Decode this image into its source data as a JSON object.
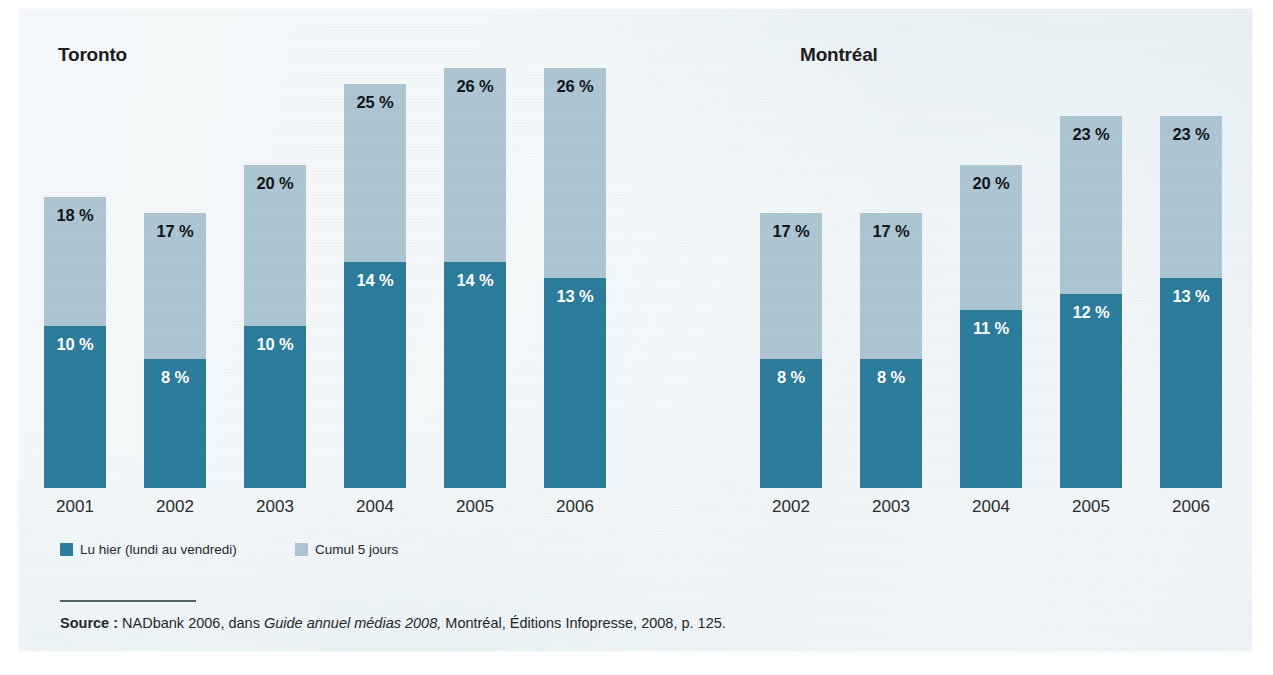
{
  "figure": {
    "background_color": "#e6eff4",
    "page_color": "#ffffff"
  },
  "colors": {
    "series_dark": "#2c7c9c",
    "series_light": "#aec6d3",
    "label_dark": "#111418",
    "label_light": "#ffffff",
    "text": "#23282c",
    "panel_bg": "#e6eff4"
  },
  "panels": [
    {
      "title": "Toronto",
      "categories": [
        "2001",
        "2002",
        "2003",
        "2004",
        "2005",
        "2006"
      ],
      "bottom_values": [
        10,
        8,
        10,
        14,
        14,
        13
      ],
      "top_values": [
        18,
        17,
        20,
        25,
        26,
        26
      ],
      "bottom_labels": [
        "10 %",
        "8 %",
        "10 %",
        "14 %",
        "14 %",
        "13 %"
      ],
      "top_labels": [
        "18 %",
        "17 %",
        "20 %",
        "25 %",
        "26 %",
        "26 %"
      ]
    },
    {
      "title": "Montréal",
      "categories": [
        "2002",
        "2003",
        "2004",
        "2005",
        "2006"
      ],
      "bottom_values": [
        8,
        8,
        11,
        12,
        13
      ],
      "top_values": [
        17,
        17,
        20,
        23,
        23
      ],
      "bottom_labels": [
        "8 %",
        "8 %",
        "11 %",
        "12 %",
        "13 %"
      ],
      "top_labels": [
        "17 %",
        "17 %",
        "20 %",
        "23 %",
        "23 %"
      ]
    }
  ],
  "legend": {
    "items": [
      {
        "label": "Lu hier (lundi au vendredi)",
        "color": "#2c7c9c",
        "swatch_name": "legend-swatch-lu-hier"
      },
      {
        "label": "Cumul 5 jours",
        "color": "#aec6d3",
        "swatch_name": "legend-swatch-cumul"
      }
    ]
  },
  "source": {
    "prefix": "Source :",
    "part1": " NADbank 2006, dans ",
    "italic": "Guide annuel médias 2008,",
    "part2": " Montréal, Éditions Infopresse, 2008, p. 125."
  },
  "chart_data": {
    "type": "bar",
    "subtype": "stacked-bar",
    "title": "",
    "xlabel": "",
    "ylabel": "",
    "unit": "%",
    "ylim": [
      0,
      26
    ],
    "grid": false,
    "legend_position": "bottom-left",
    "panels": [
      {
        "name": "Toronto",
        "categories": [
          "2001",
          "2002",
          "2003",
          "2004",
          "2005",
          "2006"
        ],
        "series": [
          {
            "name": "Lu hier (lundi au vendredi)",
            "values": [
              10,
              8,
              10,
              14,
              14,
              13
            ],
            "color": "#2c7c9c"
          },
          {
            "name": "Cumul 5 jours",
            "values": [
              18,
              17,
              20,
              25,
              26,
              26
            ],
            "color": "#aec6d3"
          }
        ],
        "note": "Cumul 5 jours is the total bar height; the dark segment is contained within it."
      },
      {
        "name": "Montréal",
        "categories": [
          "2002",
          "2003",
          "2004",
          "2005",
          "2006"
        ],
        "series": [
          {
            "name": "Lu hier (lundi au vendredi)",
            "values": [
              8,
              8,
              11,
              12,
              13
            ],
            "color": "#2c7c9c"
          },
          {
            "name": "Cumul 5 jours",
            "values": [
              17,
              17,
              20,
              23,
              23
            ],
            "color": "#aec6d3"
          }
        ],
        "note": "Cumul 5 jours is the total bar height; the dark segment is contained within it."
      }
    ]
  }
}
